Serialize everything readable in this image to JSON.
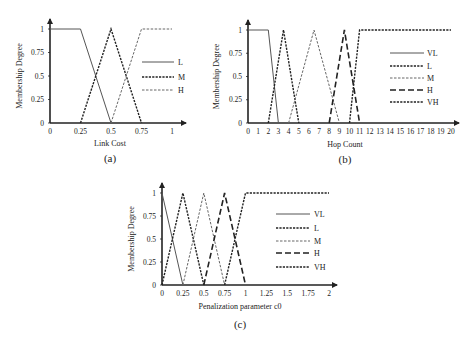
{
  "chart_data": [
    {
      "id": "a",
      "type": "line",
      "caption": "(a)",
      "xlabel": "Link Cost",
      "ylabel": "Membership Degree",
      "xlim": [
        0,
        1
      ],
      "ylim": [
        0,
        1
      ],
      "xticks": [
        "0",
        "0.25",
        "0.5",
        "0.75",
        "1"
      ],
      "xtick_values": [
        0,
        0.25,
        0.5,
        0.75,
        1
      ],
      "yticks": [
        "0",
        "0.25",
        "0.5",
        "0.75",
        "1"
      ],
      "ytick_values": [
        0,
        0.25,
        0.5,
        0.75,
        1
      ],
      "grid": false,
      "legend_position": "right-inside",
      "series": [
        {
          "name": "L",
          "style": "solid",
          "points": [
            [
              0,
              1
            ],
            [
              0.25,
              1
            ],
            [
              0.5,
              0
            ]
          ]
        },
        {
          "name": "M",
          "style": "dotted-bold",
          "points": [
            [
              0.25,
              0
            ],
            [
              0.5,
              1
            ],
            [
              0.75,
              0
            ]
          ]
        },
        {
          "name": "H",
          "style": "dashed-light",
          "points": [
            [
              0.5,
              0
            ],
            [
              0.75,
              1
            ],
            [
              1,
              1
            ]
          ]
        }
      ]
    },
    {
      "id": "b",
      "type": "line",
      "caption": "(b)",
      "xlabel": "Hop Count",
      "ylabel": "Membership Degree",
      "xlim": [
        0,
        20
      ],
      "ylim": [
        0,
        1
      ],
      "xticks": [
        "0",
        "1",
        "2",
        "3",
        "4",
        "5",
        "6",
        "7",
        "8",
        "9",
        "10",
        "11",
        "12",
        "13",
        "14",
        "15",
        "16",
        "17",
        "18",
        "19",
        "20"
      ],
      "xtick_values": [
        0,
        1,
        2,
        3,
        4,
        5,
        6,
        7,
        8,
        9,
        10,
        11,
        12,
        13,
        14,
        15,
        16,
        17,
        18,
        19,
        20
      ],
      "yticks": [
        "0",
        "0.25",
        "0.5",
        "0.75",
        "1"
      ],
      "ytick_values": [
        0,
        0.25,
        0.5,
        0.75,
        1
      ],
      "grid": false,
      "legend_position": "right-inside",
      "series": [
        {
          "name": "VL",
          "style": "solid",
          "points": [
            [
              0,
              1
            ],
            [
              2,
              1
            ],
            [
              3,
              0
            ]
          ]
        },
        {
          "name": "L",
          "style": "dotted-bold",
          "points": [
            [
              2,
              0
            ],
            [
              3.5,
              1
            ],
            [
              5,
              0
            ]
          ]
        },
        {
          "name": "M",
          "style": "dashed-light",
          "points": [
            [
              4,
              0
            ],
            [
              6.5,
              1
            ],
            [
              9,
              0
            ]
          ]
        },
        {
          "name": "H",
          "style": "long-dash",
          "points": [
            [
              8,
              0
            ],
            [
              9.5,
              1
            ],
            [
              11,
              0
            ]
          ]
        },
        {
          "name": "VH",
          "style": "dotted-bold",
          "points": [
            [
              10,
              0
            ],
            [
              11,
              1
            ],
            [
              20,
              1
            ]
          ]
        }
      ]
    },
    {
      "id": "c",
      "type": "line",
      "caption": "(c)",
      "xlabel": "Penalization parameter c0",
      "ylabel": "Membership Degree",
      "xlim": [
        0,
        2
      ],
      "ylim": [
        0,
        1
      ],
      "xticks": [
        "0",
        "0.25",
        "0.5",
        "0.75",
        "1",
        "1.25",
        "1.5",
        "1.75",
        "2"
      ],
      "xtick_values": [
        0,
        0.25,
        0.5,
        0.75,
        1,
        1.25,
        1.5,
        1.75,
        2
      ],
      "yticks": [
        "0",
        "0.25",
        "0.5",
        "0.75",
        "1"
      ],
      "ytick_values": [
        0,
        0.25,
        0.5,
        0.75,
        1
      ],
      "grid": false,
      "legend_position": "right-inside",
      "series": [
        {
          "name": "VL",
          "style": "solid",
          "points": [
            [
              0,
              1
            ],
            [
              0.25,
              0
            ]
          ]
        },
        {
          "name": "L",
          "style": "dotted-bold",
          "points": [
            [
              0,
              0
            ],
            [
              0.25,
              1
            ],
            [
              0.5,
              0
            ]
          ]
        },
        {
          "name": "M",
          "style": "dashed-light",
          "points": [
            [
              0.25,
              0
            ],
            [
              0.5,
              1
            ],
            [
              0.75,
              0
            ]
          ]
        },
        {
          "name": "H",
          "style": "long-dash",
          "points": [
            [
              0.5,
              0
            ],
            [
              0.75,
              1
            ],
            [
              1,
              0
            ]
          ]
        },
        {
          "name": "VH",
          "style": "dotted-bold",
          "points": [
            [
              0.75,
              0
            ],
            [
              1,
              1
            ],
            [
              2,
              1
            ]
          ]
        }
      ]
    }
  ]
}
